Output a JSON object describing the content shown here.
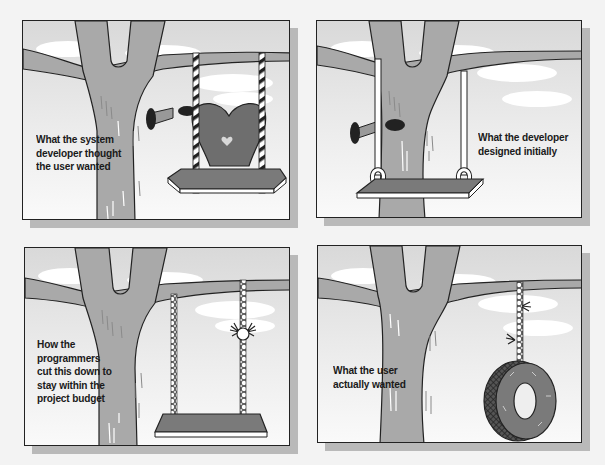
{
  "cartoon": {
    "title": "Tree swing cartoon",
    "colors": {
      "background": "#f3f3f3",
      "sky": "#dedede",
      "ground": "#f6f6f6",
      "tree": "#a9a9a9",
      "seat": "#7a7a7a",
      "heart": "#6e6e6e",
      "cloud": "#ffffff",
      "outline": "#222222",
      "shadow": "#b9b9b9"
    },
    "panels": [
      {
        "id": "system-developer",
        "caption": "What the system\ndeveloper thought\nthe user wanted",
        "illustration": "ornate swing with heart-shaped backrest and striped ropes, horn-shaped sign"
      },
      {
        "id": "developer-design",
        "caption": "What the developer\ndesigned initially",
        "illustration": "plain board swing with ropes looped around branch and seat, horn-shaped sign"
      },
      {
        "id": "programmers-cut",
        "caption": "How the\nprogrammers\ncut this down to\nstay within the\nproject budget",
        "illustration": "swing with beaded ropes, one rope cut and frayed"
      },
      {
        "id": "user-wanted",
        "caption": "What the user\nactually wanted",
        "illustration": "tire swing hanging from a single rope"
      }
    ]
  }
}
